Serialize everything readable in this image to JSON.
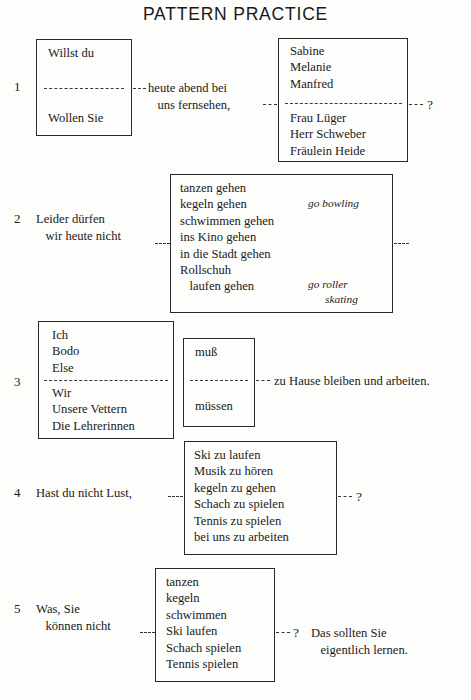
{
  "page": {
    "title": "PATTERN PRACTICE",
    "document_type": "language-exercise-worksheet",
    "language": "German",
    "ink_color": "#1a1a1a",
    "paper_color": "#fdfdfb"
  },
  "exercises": [
    {
      "number": "1",
      "left_box": {
        "top_options": [
          "Willst du"
        ],
        "bottom_options": [
          "Wollen Sie"
        ]
      },
      "middle_text": "heute abend bei\n   uns fernsehen,",
      "right_box": {
        "top_options": [
          "Sabine",
          "Melanie",
          "Manfred"
        ],
        "bottom_options": [
          "Frau Lüger",
          "Herr Schweber",
          "Fräulein Heide"
        ]
      },
      "terminator": "?"
    },
    {
      "number": "2",
      "lead_text": "Leider dürfen\n   wir heute nicht",
      "box_items": [
        "tanzen gehen",
        "kegeln gehen",
        "schwimmen gehen",
        "ins Kino gehen",
        "in die Stadt gehen",
        "Rollschuh",
        "   laufen gehen"
      ],
      "glosses": [
        {
          "text": "go bowling",
          "row": 2
        },
        {
          "text": "go roller",
          "row": 6
        },
        {
          "text": "skating",
          "row": 7
        }
      ],
      "terminator": ""
    },
    {
      "number": "3",
      "left_box": {
        "top_options": [
          "Ich",
          "Bodo",
          "Else"
        ],
        "bottom_options": [
          "Wir",
          "Unsere Vettern",
          "Die Lehrerinnen"
        ]
      },
      "middle_box": {
        "top_options": [
          "muß"
        ],
        "bottom_options": [
          "müssen"
        ]
      },
      "tail_text": "zu Hause bleiben und arbeiten."
    },
    {
      "number": "4",
      "lead_text": "Hast du nicht Lust,",
      "box_items": [
        "Ski zu laufen",
        "Musik zu hören",
        "kegeln zu gehen",
        "Schach zu spielen",
        "Tennis zu spielen",
        "bei uns zu arbeiten"
      ],
      "terminator": "?"
    },
    {
      "number": "5",
      "lead_text": "Was, Sie\n   können nicht",
      "box_items": [
        "tanzen",
        "kegeln",
        "schwimmen",
        "Ski laufen",
        "Schach spielen",
        "Tennis spielen"
      ],
      "terminator": "?",
      "tail_text": "Das sollten Sie\n   eigentlich lernen."
    }
  ]
}
